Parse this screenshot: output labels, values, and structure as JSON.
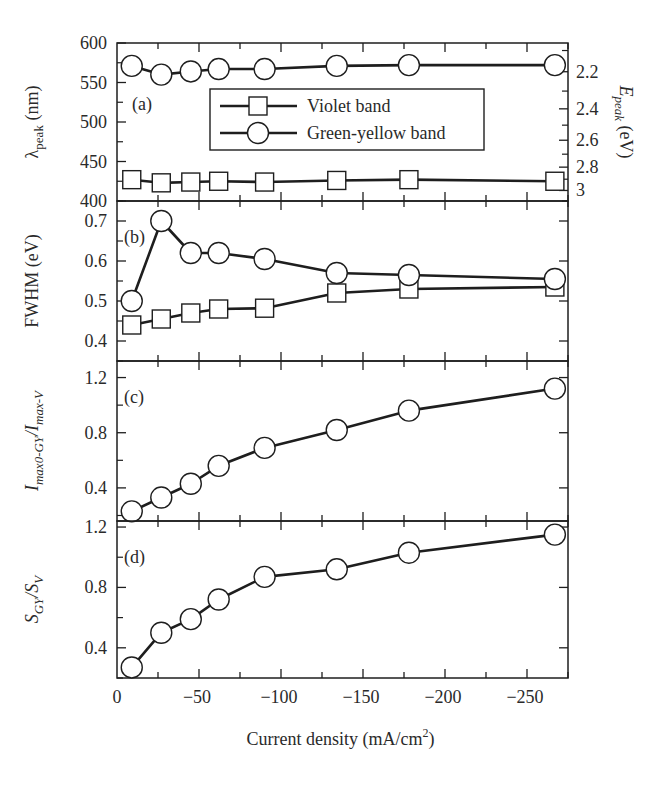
{
  "chart_data": {
    "type": "line",
    "layout": "4 vertically stacked panels sharing x-axis",
    "xlabel": "Current density (mA/cm²)",
    "xlabel_base": "Current density (mA/cm",
    "xlabel_sup": "2",
    "xlabel_tail": ")",
    "xlim": [
      0,
      -275
    ],
    "x_ticks": [
      0,
      -50,
      -100,
      -150,
      -200,
      -250
    ],
    "x_tick_labels": [
      "0",
      "−50",
      "−100",
      "−150",
      "−200",
      "−250"
    ],
    "x": [
      -9,
      -27,
      -45,
      -62,
      -90,
      -134,
      -178,
      -267
    ],
    "legend": {
      "position": "inside panel (a), upper center",
      "entries": [
        {
          "label": "Violet band",
          "marker": "square"
        },
        {
          "label": "Green-yellow band",
          "marker": "circle"
        }
      ]
    },
    "panels": [
      {
        "tag": "(a)",
        "ylabel": "λ_peak (nm)",
        "ylabel_main": "λ",
        "ylabel_sub": "peak",
        "ylabel_unit": " (nm)",
        "ylim": [
          400,
          600
        ],
        "y_ticks": [
          400,
          450,
          500,
          550,
          600
        ],
        "y_tick_labels": [
          "400",
          "450",
          "500",
          "550",
          "600"
        ],
        "secondary_y": {
          "label": "E_peak (eV)",
          "label_main": "E",
          "label_sub": "peak",
          "label_unit": " (eV)",
          "ticks": [
            2.2,
            2.4,
            2.6,
            2.8,
            3.0
          ],
          "tick_labels": [
            "2.2",
            "2.4",
            "2.6",
            "2.8",
            "3"
          ],
          "minor_ticks": [
            2.1,
            2.3,
            2.5,
            2.7,
            2.9,
            3.1
          ],
          "conversion": "E = 1240 / lambda"
        },
        "series": [
          {
            "name": "Violet band",
            "marker": "square",
            "values": [
              427,
              423,
              424,
              425,
              424,
              426,
              427,
              425
            ]
          },
          {
            "name": "Green-yellow band",
            "marker": "circle",
            "values": [
              571,
              560,
              564,
              567,
              567,
              571,
              572,
              572
            ]
          }
        ]
      },
      {
        "tag": "(b)",
        "ylabel": "FWHM (eV)",
        "ylim": [
          0.35,
          0.75
        ],
        "y_ticks": [
          0.4,
          0.5,
          0.6,
          0.7
        ],
        "y_tick_labels": [
          "0.4",
          "0.5",
          "0.6",
          "0.7"
        ],
        "series": [
          {
            "name": "Violet band",
            "marker": "square",
            "values": [
              0.44,
              0.455,
              0.47,
              0.48,
              0.482,
              0.52,
              0.53,
              0.535
            ]
          },
          {
            "name": "Green-yellow band",
            "marker": "circle",
            "values": [
              0.5,
              0.7,
              0.62,
              0.62,
              0.605,
              0.57,
              0.565,
              0.555
            ]
          }
        ]
      },
      {
        "tag": "(c)",
        "ylabel": "I_max0-GY / I_max-V",
        "ylabel_a": "I",
        "ylabel_a_sub": "max0-GY",
        "ylabel_b": "/I",
        "ylabel_b_sub": "max-V",
        "ylim": [
          0.16,
          1.32
        ],
        "y_ticks": [
          0.4,
          0.8,
          1.2
        ],
        "y_tick_labels": [
          "0.4",
          "0.8",
          "1.2"
        ],
        "series": [
          {
            "name": "Green-yellow / Violet",
            "marker": "circle",
            "values": [
              0.23,
              0.33,
              0.43,
              0.56,
              0.69,
              0.82,
              0.96,
              1.12
            ]
          }
        ]
      },
      {
        "tag": "(d)",
        "ylabel": "S_GY / S_V",
        "ylabel_a": "S",
        "ylabel_a_sub": "GY",
        "ylabel_b": "/S",
        "ylabel_b_sub": "V",
        "ylim": [
          0.2,
          1.24
        ],
        "y_ticks": [
          0.4,
          0.8,
          1.2
        ],
        "y_tick_labels": [
          "0.4",
          "0.8",
          "1.2"
        ],
        "series": [
          {
            "name": "Green-yellow / Violet",
            "marker": "circle",
            "values": [
              0.27,
              0.5,
              0.59,
              0.72,
              0.87,
              0.92,
              1.03,
              1.15
            ]
          }
        ]
      }
    ],
    "grid": false
  },
  "colors": {
    "ink": "#2a2a2a",
    "line": "#1e1e1e",
    "marker_fill": "#ffffff",
    "background": "#ffffff"
  }
}
